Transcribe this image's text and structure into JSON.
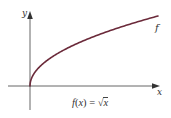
{
  "figure": {
    "caption_func": "f",
    "caption_open": "(",
    "caption_var": "x",
    "caption_close": ")",
    "caption_eq": " = ",
    "caption_radical": "√",
    "caption_radicand": "x",
    "caption_full": "f(x) = √x",
    "axis_x_label": "x",
    "axis_y_label": "y",
    "curve_label": "f"
  },
  "colors": {
    "curve": "#6b2a3a",
    "axis": "#555555",
    "text": "#333333"
  },
  "chart_data": {
    "type": "line",
    "title": "f(x) = √x",
    "xlabel": "x",
    "ylabel": "y",
    "series": [
      {
        "name": "f",
        "function": "sqrt(x)",
        "x": [
          0,
          0.25,
          1,
          2.25,
          4,
          6.25,
          9,
          12.25,
          16
        ],
        "values": [
          0,
          0.5,
          1,
          1.5,
          2,
          2.5,
          3,
          3.5,
          4
        ]
      }
    ],
    "legend": [],
    "annotations": [
      "f",
      "f(x) = √x"
    ],
    "grid": false,
    "ticks": "none",
    "xlim": [
      -3,
      16.5
    ],
    "ylim": [
      -3,
      9
    ]
  }
}
